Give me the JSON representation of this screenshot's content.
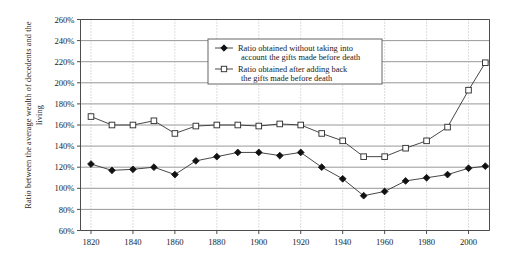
{
  "chart_data": {
    "type": "line",
    "title": "",
    "xlabel": "",
    "ylabel": "Ratio between the average wealth of decedents and the living",
    "xlim": [
      1815,
      2010
    ],
    "ylim": [
      60,
      260
    ],
    "ytick_step": 20,
    "ytick_labels": [
      "260%",
      "240%",
      "220%",
      "200%",
      "180%",
      "160%",
      "140%",
      "120%",
      "100%",
      "80%",
      "60%"
    ],
    "ytick_values": [
      260,
      240,
      220,
      200,
      180,
      160,
      140,
      120,
      100,
      80,
      60
    ],
    "xtick_labels": [
      "1820",
      "1840",
      "1860",
      "1880",
      "1900",
      "1920",
      "1940",
      "1960",
      "1980",
      "2000"
    ],
    "xtick_values": [
      1820,
      1840,
      1860,
      1880,
      1900,
      1920,
      1940,
      1960,
      1980,
      2000
    ],
    "grid": "horizontal-solid-and-vertical-dotted",
    "legend_position": "top-center-right",
    "x": [
      1820,
      1830,
      1840,
      1850,
      1860,
      1870,
      1880,
      1890,
      1900,
      1910,
      1920,
      1930,
      1940,
      1950,
      1960,
      1970,
      1980,
      1990,
      2000,
      2008
    ],
    "series": [
      {
        "name": "Ratio obtained without taking into account the gifts made before death",
        "marker": "filled-diamond",
        "values": [
          123,
          117,
          118,
          120,
          113,
          126,
          130,
          134,
          134,
          131,
          134,
          120,
          109,
          93,
          97,
          107,
          110,
          113,
          119,
          121
        ]
      },
      {
        "name": "Ratio obtained after adding back the gifts made before death",
        "marker": "open-square",
        "values": [
          168,
          160,
          160,
          164,
          152,
          159,
          160,
          160,
          159,
          161,
          160,
          152,
          145,
          130,
          130,
          138,
          145,
          158,
          193,
          219
        ]
      }
    ],
    "legend": [
      {
        "marker": "filled-diamond",
        "line1": "Ratio obtained without taking into",
        "line2": "account the gifts made before death"
      },
      {
        "marker": "open-square",
        "line1": "Ratio obtained after adding back",
        "line2": "the gifts made before death"
      }
    ],
    "colors": {
      "line": "#333333",
      "marker_fill_series1": "#111111",
      "marker_fill_series2": "#ffffff",
      "grid_solid": "#8c8c8c",
      "grid_dotted": "#b4b4b4",
      "axis": "#4d4d4d",
      "text": "#1a1a1a",
      "background": "#ffffff"
    }
  }
}
